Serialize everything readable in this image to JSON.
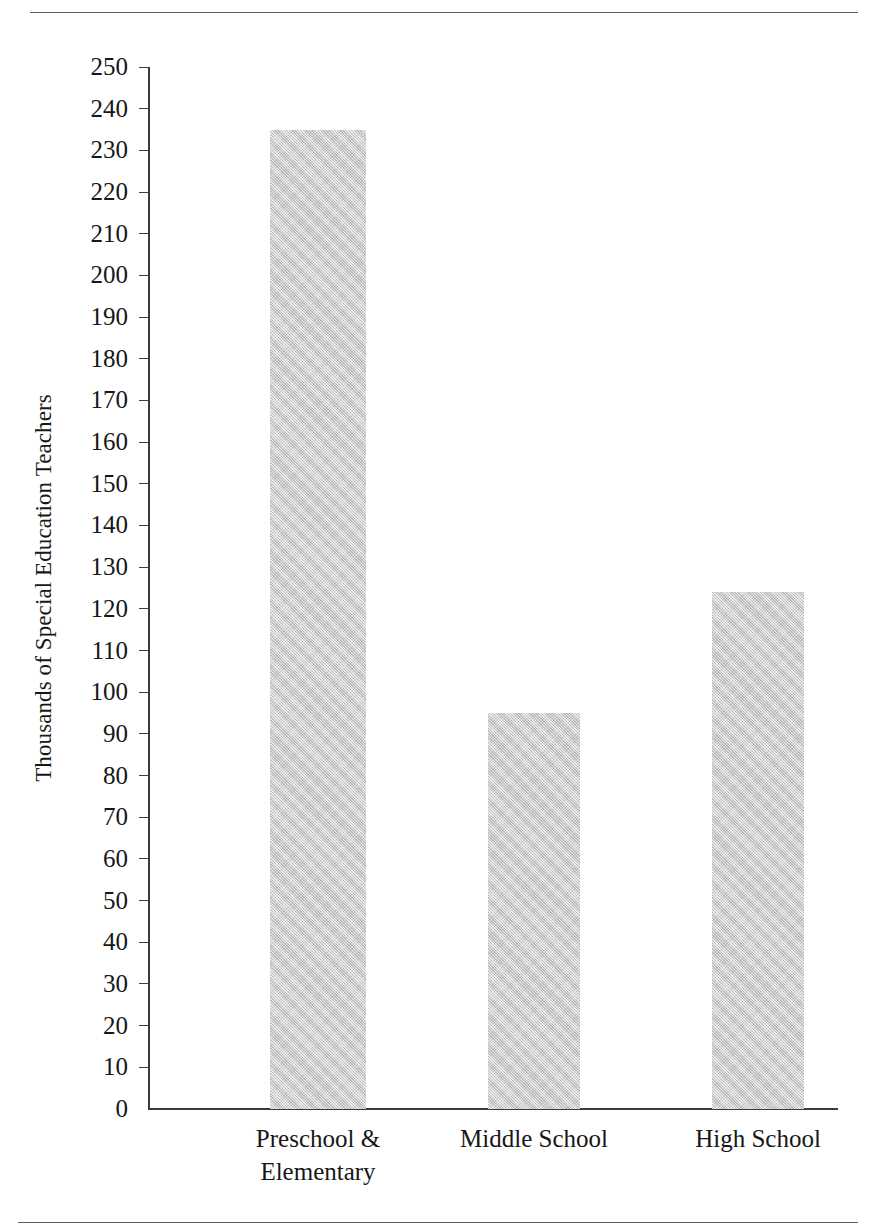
{
  "page": {
    "running_head": "",
    "background_color": "#ffffff",
    "rule_color": "#5a5a5a"
  },
  "figure": {
    "bar_fill_color": "#c9c9c9",
    "axis_color": "#3b3b3b",
    "text_color": "#171717"
  },
  "chart_data": {
    "type": "bar",
    "title": "",
    "xlabel": "",
    "ylabel": "Thousands of Special Education Teachers",
    "categories": [
      "Preschool &\nElementary",
      "Middle School",
      "High School"
    ],
    "values": [
      235,
      95,
      124
    ],
    "ylim": [
      0,
      250
    ],
    "ytick_step": 10,
    "yticks": [
      0,
      10,
      20,
      30,
      40,
      50,
      60,
      70,
      80,
      90,
      100,
      110,
      120,
      130,
      140,
      150,
      160,
      170,
      180,
      190,
      200,
      210,
      220,
      230,
      240,
      250
    ],
    "ytick_labels": [
      "0",
      "10",
      "20",
      "30",
      "40",
      "50",
      "60",
      "70",
      "80",
      "90",
      "100",
      "110",
      "120",
      "130",
      "140",
      "150",
      "160",
      "170",
      "180",
      "190",
      "200",
      "210",
      "220",
      "230",
      "240",
      "250"
    ],
    "grid": false,
    "legend": false,
    "legend_position": "none",
    "series": [
      {
        "name": "Special Education Teachers",
        "values": [
          235,
          95,
          124
        ]
      }
    ]
  }
}
